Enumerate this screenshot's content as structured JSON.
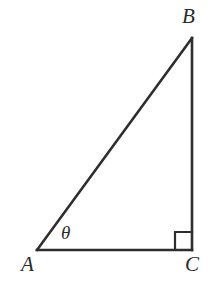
{
  "figure": {
    "kind": "right-triangle-diagram",
    "width": 214,
    "height": 287,
    "background_color": "#ffffff",
    "stroke_color": "#2e2e2e",
    "stroke_width": 2.6
  },
  "labels": {
    "vertex_a": "A",
    "vertex_b": "B",
    "vertex_c": "C",
    "angle_theta": "θ"
  },
  "geometry": {
    "vertices": {
      "A": {
        "x": 37,
        "y": 250
      },
      "B": {
        "x": 192,
        "y": 38
      },
      "C": {
        "x": 192,
        "y": 250
      }
    },
    "edges": [
      {
        "name": "hypotenuse-ab",
        "from": "A",
        "to": "B"
      },
      {
        "name": "vertical-bc",
        "from": "B",
        "to": "C"
      },
      {
        "name": "base-ac",
        "from": "A",
        "to": "C"
      }
    ],
    "right_angle_marker": {
      "at_vertex": "C",
      "size": 17,
      "x": 175,
      "y": 232
    },
    "angle_theta_at_vertex": "A"
  },
  "chart_data": {
    "type": "diagram",
    "title": "",
    "points": [
      {
        "label": "A",
        "x": 37,
        "y": 250
      },
      {
        "label": "B",
        "x": 192,
        "y": 38
      },
      {
        "label": "C",
        "x": 192,
        "y": 250
      }
    ],
    "annotations": [
      {
        "text": "θ",
        "at": "A",
        "x": 68,
        "y": 233
      },
      {
        "text": "right-angle",
        "at": "C",
        "x": 183,
        "y": 241
      }
    ]
  }
}
